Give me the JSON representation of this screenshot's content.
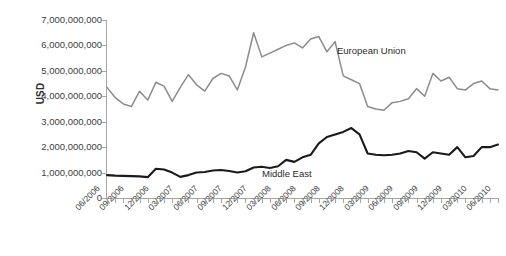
{
  "chart_data": {
    "type": "line",
    "title": "",
    "xlabel": "",
    "ylabel": "USD",
    "ylim": [
      0,
      7000000000
    ],
    "ytick_labels": [
      "7,000,000,000",
      "6,000,000,000",
      "5,000,000,000",
      "4,000,000,000",
      "3,000,000,000",
      "2,000,000,000",
      "1,000,000,000",
      "0"
    ],
    "ytick_values": [
      7000000000,
      6000000000,
      5000000000,
      4000000000,
      3000000000,
      2000000000,
      1000000000,
      0
    ],
    "grid": false,
    "legend_position": "inline-annotation",
    "x": [
      "06/2006",
      "07/2006",
      "08/2006",
      "09/2006",
      "10/2006",
      "11/2006",
      "12/2006",
      "01/2007",
      "02/2007",
      "03/2007",
      "04/2007",
      "05/2007",
      "06/2007",
      "07/2007",
      "08/2007",
      "09/2007",
      "10/2007",
      "11/2007",
      "12/2007",
      "01/2008",
      "02/2008",
      "03/2008",
      "04/2008",
      "05/2008",
      "06/2008",
      "07/2008",
      "08/2008",
      "09/2008",
      "10/2008",
      "11/2008",
      "12/2008",
      "01/2009",
      "02/2009",
      "03/2009",
      "04/2009",
      "05/2009",
      "06/2009",
      "07/2009",
      "08/2009",
      "09/2009",
      "10/2009",
      "11/2009",
      "12/2009",
      "01/2010",
      "02/2010",
      "03/2010",
      "04/2010",
      "05/2010",
      "06/2010"
    ],
    "xtick_labels": [
      "06/2006",
      "09/2006",
      "12/2006",
      "03/2007",
      "06/2007",
      "09/2007",
      "12/2007",
      "03/2008",
      "06/2008",
      "09/2008",
      "12/2008",
      "03/2009",
      "06/2009",
      "09/2009",
      "12/2009",
      "03/2010",
      "06/2010"
    ],
    "xtick_indices": [
      0,
      3,
      6,
      9,
      12,
      15,
      18,
      21,
      24,
      27,
      30,
      33,
      36,
      39,
      42,
      45,
      48
    ],
    "series": [
      {
        "name": "European Union",
        "color": "#8c8c8c",
        "values": [
          4350000000,
          3950000000,
          3700000000,
          3600000000,
          4200000000,
          3850000000,
          4550000000,
          4400000000,
          3800000000,
          4350000000,
          4850000000,
          4450000000,
          4200000000,
          4700000000,
          4900000000,
          4800000000,
          4250000000,
          5150000000,
          6500000000,
          5550000000,
          5700000000,
          5850000000,
          6000000000,
          6100000000,
          5900000000,
          6250000000,
          6350000000,
          5750000000,
          6150000000,
          4800000000,
          4650000000,
          4500000000,
          3600000000,
          3500000000,
          3450000000,
          3750000000,
          3800000000,
          3900000000,
          4300000000,
          4000000000,
          4900000000,
          4600000000,
          4750000000,
          4300000000,
          4250000000,
          4500000000,
          4600000000,
          4300000000,
          4250000000
        ]
      },
      {
        "name": "Middle East",
        "color": "#1a1a1a",
        "values": [
          900000000,
          880000000,
          870000000,
          860000000,
          850000000,
          820000000,
          1150000000,
          1120000000,
          1000000000,
          830000000,
          900000000,
          1000000000,
          1020000000,
          1080000000,
          1100000000,
          1060000000,
          1000000000,
          1050000000,
          1200000000,
          1230000000,
          1180000000,
          1250000000,
          1500000000,
          1420000000,
          1600000000,
          1700000000,
          2150000000,
          2400000000,
          2500000000,
          2600000000,
          2750000000,
          2500000000,
          1750000000,
          1700000000,
          1680000000,
          1700000000,
          1750000000,
          1850000000,
          1800000000,
          1550000000,
          1800000000,
          1750000000,
          1700000000,
          2000000000,
          1600000000,
          1650000000,
          2000000000,
          2000000000,
          2100000000
        ]
      }
    ]
  },
  "annotations": {
    "eu_label": "European Union",
    "me_label": "Middle East"
  }
}
